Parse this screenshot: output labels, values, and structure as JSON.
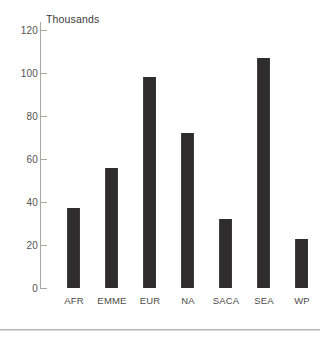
{
  "chart_data": {
    "type": "bar",
    "title": "",
    "unit_label": "Thousands",
    "xlabel": "",
    "ylabel": "",
    "categories": [
      "AFR",
      "EMME",
      "EUR",
      "NA",
      "SACA",
      "SEA",
      "WP"
    ],
    "values": [
      37,
      56,
      98,
      72,
      32,
      107,
      23
    ],
    "ylim": [
      0,
      120
    ],
    "yticks": [
      0,
      20,
      40,
      60,
      80,
      100,
      120
    ],
    "ytick_labels": [
      "0",
      "20",
      "40",
      "60",
      "80",
      "100",
      "120"
    ],
    "grid": false,
    "legend": null,
    "series": [
      {
        "name": "",
        "values": [
          37,
          56,
          98,
          72,
          32,
          107,
          23
        ]
      }
    ],
    "colors": {
      "bar": "#2e2c2d",
      "axis": "#a9a6a4",
      "text": "#4a4a4a",
      "background": "#ffffff",
      "page_rule": "#b6b3b1"
    }
  }
}
